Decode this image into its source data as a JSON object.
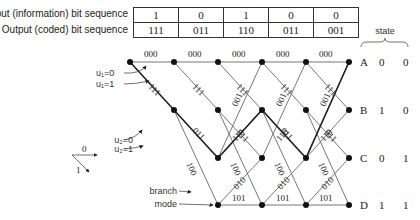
{
  "sequence_table": {
    "input_label": "Input (information) bit sequence",
    "output_label": "Output (coded) bit sequence",
    "input_bits": [
      "1",
      "0",
      "1",
      "0",
      "0"
    ],
    "output_bits": [
      "111",
      "011",
      "110",
      "011",
      "001"
    ]
  },
  "state_header": "state",
  "states": [
    {
      "name": "A",
      "bits": [
        "0",
        "0"
      ]
    },
    {
      "name": "B",
      "bits": [
        "1",
        "0"
      ]
    },
    {
      "name": "C",
      "bits": [
        "0",
        "1"
      ]
    },
    {
      "name": "D",
      "bits": [
        "1",
        "1"
      ]
    }
  ],
  "transitions": [
    {
      "from": "A",
      "to": "A",
      "output": "000"
    },
    {
      "from": "A",
      "to": "B",
      "output": "111"
    },
    {
      "from": "B",
      "to": "C",
      "output": "011"
    },
    {
      "from": "B",
      "to": "D",
      "output": "100"
    },
    {
      "from": "C",
      "to": "A",
      "output": "001"
    },
    {
      "from": "C",
      "to": "B",
      "output": "110"
    },
    {
      "from": "D",
      "to": "C",
      "output": "010"
    },
    {
      "from": "D",
      "to": "D",
      "output": "101"
    }
  ],
  "highlighted_path": [
    "A",
    "B",
    "C",
    "B",
    "C",
    "A"
  ],
  "annotations": {
    "u1_0": "u₁=0",
    "u1_1": "u₁=1",
    "u2_0": "u₂=0",
    "u2_1": "u₂=1",
    "branch": "branch",
    "mode": "mode"
  },
  "legend": {
    "zero": "0",
    "one": "1"
  }
}
